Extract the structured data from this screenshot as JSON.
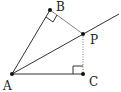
{
  "diagram": {
    "points": {
      "A": {
        "label": "A",
        "x": 12,
        "y": 74,
        "label_x": 3,
        "label_y": 90
      },
      "B": {
        "label": "B",
        "x": 50,
        "y": 10,
        "label_x": 56,
        "label_y": 11
      },
      "P": {
        "label": "P",
        "x": 83,
        "y": 34,
        "label_x": 90,
        "label_y": 44
      },
      "C": {
        "label": "C",
        "x": 83,
        "y": 74,
        "label_x": 89,
        "label_y": 86
      }
    },
    "segments": [
      {
        "from": "A",
        "to": "B",
        "style": "solid"
      },
      {
        "from": "A",
        "to": "C",
        "style": "solid"
      },
      {
        "from": "B",
        "to": "P",
        "style": "solid"
      },
      {
        "from": "P",
        "to": "C",
        "style": "dotted"
      }
    ],
    "ray": {
      "from": "A",
      "through": "P"
    },
    "right_angles": [
      "B",
      "C"
    ],
    "colors": {
      "line": "#333333",
      "dotted": "#777777",
      "point": "#111111"
    }
  }
}
